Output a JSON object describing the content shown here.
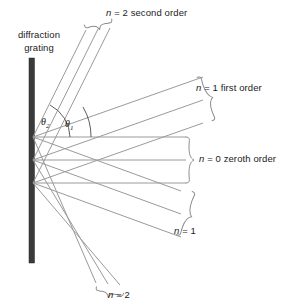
{
  "figure": {
    "title_text": "diffraction grating diagram",
    "background": "#ffffff",
    "grating": {
      "label_line1": "diffraction",
      "label_line2": "grating",
      "color": "#3a3a3a",
      "x": 29,
      "y_top": 58,
      "y_bottom": 263,
      "width": 5
    },
    "ray_color": "#8c8c8c",
    "brace_color": "#8c8c8c",
    "angles": [
      {
        "name": "theta-2",
        "symbol": "θ",
        "subscript": "2",
        "x": 41,
        "y": 116
      },
      {
        "name": "theta-1",
        "symbol": "θ",
        "subscript": "1",
        "x": 65,
        "y": 118
      }
    ],
    "sources": [
      {
        "x": 33,
        "y": 137
      },
      {
        "x": 33,
        "y": 160
      },
      {
        "x": 33,
        "y": 183
      }
    ],
    "orders": [
      {
        "name": "second-order-up",
        "label": "n = 2 second order",
        "label_italic_n": "n",
        "label_rest": " = 2 second order",
        "n": 2,
        "direction": "up",
        "angle_deg": 63
      },
      {
        "name": "first-order-up",
        "label": "n = 1 first order",
        "label_italic_n": "n",
        "label_rest": " = 1 first order",
        "n": 1,
        "direction": "up",
        "angle_deg": 30
      },
      {
        "name": "zeroth-order",
        "label": "n = 0 zeroth order",
        "label_italic_n": "n",
        "label_rest": " = 0 zeroth order",
        "n": 0,
        "direction": "straight",
        "angle_deg": 0
      },
      {
        "name": "first-order-down",
        "label": "n = 1",
        "label_italic_n": "n",
        "label_rest": " = 1",
        "n": 1,
        "direction": "down",
        "angle_deg": -30
      },
      {
        "name": "second-order-down",
        "label": "n = 2",
        "label_italic_n": "n",
        "label_rest": " = 2",
        "n": 2,
        "direction": "down",
        "angle_deg": -63
      }
    ]
  }
}
